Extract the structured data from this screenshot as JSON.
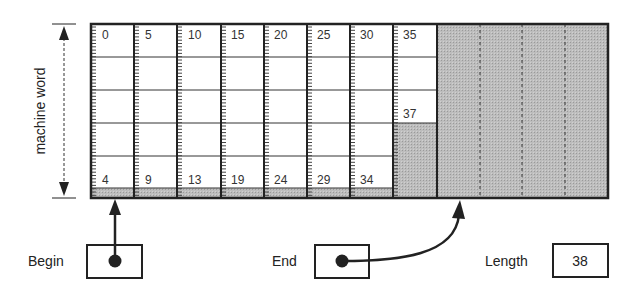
{
  "diagram": {
    "axis_label": "machine word",
    "columns": [
      {
        "top": "0",
        "bottom": "4"
      },
      {
        "top": "5",
        "bottom": "9"
      },
      {
        "top": "10",
        "bottom": "13"
      },
      {
        "top": "15",
        "bottom": "19"
      },
      {
        "top": "20",
        "bottom": "24"
      },
      {
        "top": "25",
        "bottom": "29"
      },
      {
        "top": "30",
        "bottom": "34"
      },
      {
        "top": "35",
        "mid": "37"
      }
    ],
    "pointers": {
      "begin_label": "Begin",
      "end_label": "End",
      "length_label": "Length",
      "length_value": "38"
    },
    "colors": {
      "grid_line": "#222222",
      "shade": "#b8b8b8",
      "background": "#ffffff"
    }
  }
}
